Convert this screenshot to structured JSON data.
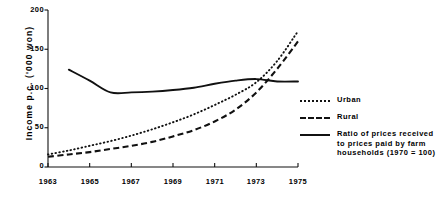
{
  "chart_data": {
    "type": "line",
    "title": "",
    "xlabel": "",
    "ylabel": "Income p.c. ('000 won)",
    "xlim": [
      1963,
      1975
    ],
    "ylim": [
      0,
      200
    ],
    "ytick_labels": [
      "0",
      "50",
      "100",
      "150",
      "200"
    ],
    "ytick_values": [
      0,
      50,
      100,
      150,
      200
    ],
    "xtick_labels": [
      "1963",
      "1965",
      "1967",
      "1969",
      "1971",
      "1973",
      "1975"
    ],
    "xtick_values": [
      1963,
      1965,
      1967,
      1969,
      1971,
      1973,
      1975
    ],
    "grid": false,
    "legend_position": "right",
    "series": [
      {
        "name": "Urban",
        "style": "dotted",
        "color": "#111111",
        "x": [
          1963,
          1964,
          1965,
          1966,
          1967,
          1968,
          1969,
          1970,
          1971,
          1972,
          1973,
          1974,
          1975
        ],
        "values": [
          16,
          21,
          27,
          33,
          40,
          48,
          57,
          67,
          79,
          92,
          108,
          135,
          173
        ]
      },
      {
        "name": "Rural",
        "style": "dashed",
        "color": "#111111",
        "x": [
          1963,
          1964,
          1965,
          1966,
          1967,
          1968,
          1969,
          1970,
          1971,
          1972,
          1973,
          1974,
          1975
        ],
        "values": [
          13,
          16,
          19,
          23,
          27,
          32,
          39,
          47,
          58,
          73,
          95,
          125,
          160
        ]
      },
      {
        "name": "Ratio of prices received to prices paid by farm households (1970 = 100)",
        "style": "solid",
        "color": "#111111",
        "x": [
          1964,
          1965,
          1966,
          1967,
          1968,
          1969,
          1970,
          1971,
          1972,
          1973,
          1974,
          1975
        ],
        "values": [
          124,
          110,
          95,
          95,
          96,
          98,
          101,
          106,
          110,
          112,
          109,
          109
        ]
      }
    ]
  },
  "legend": {
    "items": [
      {
        "label": "Urban",
        "sample": "dotted-line-sample"
      },
      {
        "label": "Rural",
        "sample": "dashed-line-sample"
      }
    ],
    "ratio": {
      "line1": "Ratio of prices received",
      "line2": "to prices paid by farm",
      "line3": "households (1970 = 100)",
      "sample": "solid-line-sample"
    }
  },
  "axes": {
    "y_title": "Income p.c. ('000 won)"
  }
}
